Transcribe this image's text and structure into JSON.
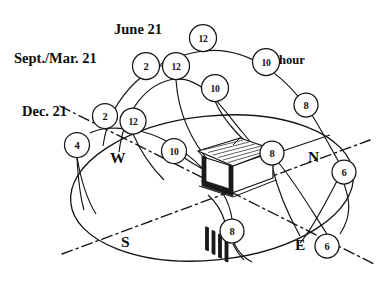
{
  "diagram": {
    "labels": {
      "june": "June 21",
      "equinox": "Sept./Mar. 21",
      "december": "Dec. 21",
      "hour_unit": "hour"
    },
    "cardinals": [
      {
        "name": "west",
        "text": "W",
        "x": 110,
        "y": 149
      },
      {
        "name": "north",
        "text": "N",
        "x": 308,
        "y": 148
      },
      {
        "name": "south",
        "text": "S",
        "x": 121,
        "y": 233
      },
      {
        "name": "east",
        "text": "E",
        "x": 295,
        "y": 236
      }
    ],
    "hour_nodes": [
      {
        "id": "jun-12",
        "label": "12",
        "cx": 203,
        "cy": 38,
        "r": 13.5,
        "path": "june"
      },
      {
        "id": "jun-10",
        "label": "10",
        "cx": 266,
        "cy": 62,
        "r": 13.5,
        "path": "june"
      },
      {
        "id": "jun-8",
        "label": "8",
        "cx": 306,
        "cy": 105,
        "r": 12.0,
        "path": "june"
      },
      {
        "id": "jun-6",
        "label": "6",
        "cx": 344,
        "cy": 172,
        "r": 12.0,
        "path": "june"
      },
      {
        "id": "jun-2",
        "label": "2",
        "cx": 146,
        "cy": 66,
        "r": 13.5,
        "path": "june"
      },
      {
        "id": "eq-12",
        "label": "12",
        "cx": 176,
        "cy": 66,
        "r": 13.5,
        "path": "equinox"
      },
      {
        "id": "eq-10",
        "label": "10",
        "cx": 215,
        "cy": 88,
        "r": 13.5,
        "path": "equinox"
      },
      {
        "id": "eq-8",
        "label": "8",
        "cx": 272,
        "cy": 153,
        "r": 12.0,
        "path": "equinox"
      },
      {
        "id": "eq-6",
        "label": "6",
        "cx": 327,
        "cy": 246,
        "r": 12.0,
        "path": "equinox"
      },
      {
        "id": "dec-2",
        "label": "2",
        "cx": 105,
        "cy": 116,
        "r": 12.5,
        "path": "december"
      },
      {
        "id": "dec-12",
        "label": "12",
        "cx": 133,
        "cy": 121,
        "r": 13.0,
        "path": "december"
      },
      {
        "id": "dec-10",
        "label": "10",
        "cx": 174,
        "cy": 151,
        "r": 12.5,
        "path": "december"
      },
      {
        "id": "dec-8",
        "label": "8",
        "cx": 232,
        "cy": 231,
        "r": 12.0,
        "path": "december"
      },
      {
        "id": "dec-4",
        "label": "4",
        "cx": 77,
        "cy": 145,
        "r": 12.5,
        "path": "december"
      }
    ],
    "label_positions": {
      "june": {
        "x": 114,
        "y": 21
      },
      "equinox": {
        "x": 14,
        "y": 50
      },
      "december": {
        "x": 22,
        "y": 103
      },
      "hour_unit": {
        "x": 279,
        "y": 52
      }
    },
    "colors": {
      "ink": "#141414",
      "paper": "#ffffff",
      "house_shadow": "#1a1a1a"
    }
  }
}
